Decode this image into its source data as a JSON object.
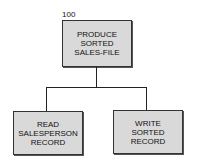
{
  "diagram": {
    "root": {
      "number": "100",
      "lines": [
        "PRODUCE",
        "SORTED",
        "SALES-FILE"
      ]
    },
    "children": [
      {
        "lines": [
          "READ",
          "SALESPERSON",
          "RECORD"
        ]
      },
      {
        "lines": [
          "WRITE",
          "SORTED",
          "RECORD"
        ]
      }
    ]
  }
}
